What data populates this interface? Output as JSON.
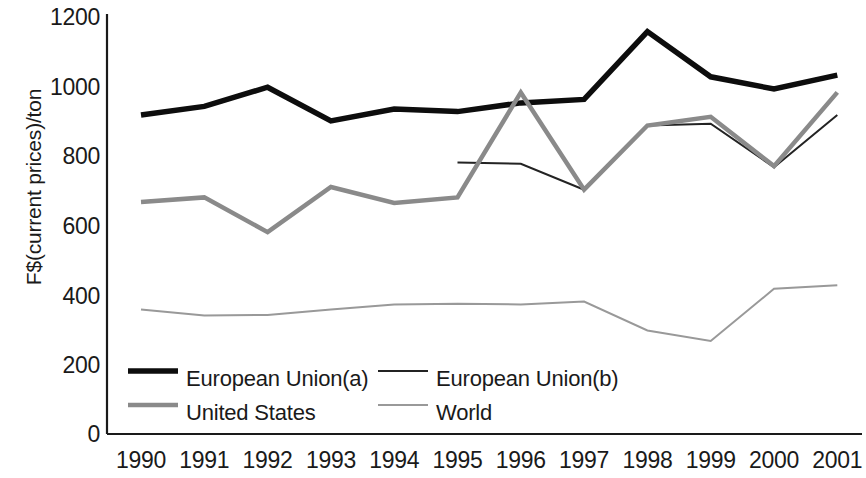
{
  "chart_data": {
    "type": "line",
    "title": "",
    "xlabel": "",
    "ylabel": "F$(current prices)/ton",
    "x": [
      1990,
      1991,
      1992,
      1993,
      1994,
      1995,
      1996,
      1997,
      1998,
      1999,
      2000,
      2001
    ],
    "categories": [
      "1990",
      "1991",
      "1992",
      "1993",
      "1994",
      "1995",
      "1996",
      "1997",
      "1998",
      "1999",
      "2000",
      "2001"
    ],
    "ylim": [
      0,
      1200
    ],
    "yticks": [
      0,
      200,
      400,
      600,
      800,
      1000,
      1200
    ],
    "ytick_labels": [
      "0",
      "200",
      "400",
      "600",
      "800",
      "1000",
      "1200"
    ],
    "grid": false,
    "legend_position": "inside-bottom-left",
    "series": [
      {
        "name": "European Union(a)",
        "color": "#0d0d0d",
        "width": 5.5,
        "x": [
          1990,
          1991,
          1992,
          1993,
          1994,
          1995,
          1996,
          1997,
          1998,
          1999,
          2000,
          2001
        ],
        "values": [
          915,
          940,
          995,
          898,
          932,
          925,
          950,
          960,
          1155,
          1025,
          990,
          1030
        ]
      },
      {
        "name": "European Union(b)",
        "color": "#232323",
        "width": 2,
        "x": [
          1995,
          1996,
          1997,
          1998,
          1999,
          2000,
          2001
        ],
        "values": [
          778,
          775,
          700,
          885,
          890,
          765,
          915
        ]
      },
      {
        "name": "United States",
        "color": "#8a8a8a",
        "width": 4.5,
        "x": [
          1990,
          1991,
          1992,
          1993,
          1994,
          1995,
          1996,
          1997,
          1998,
          1999,
          2000,
          2001
        ],
        "values": [
          665,
          678,
          578,
          708,
          662,
          678,
          980,
          700,
          885,
          910,
          768,
          980
        ]
      },
      {
        "name": "World",
        "color": "#999999",
        "width": 2,
        "x": [
          1990,
          1991,
          1992,
          1993,
          1994,
          1995,
          1996,
          1997,
          1998,
          1999,
          2000,
          2001
        ],
        "values": [
          355,
          338,
          340,
          355,
          370,
          372,
          370,
          378,
          295,
          265,
          415,
          425
        ]
      }
    ]
  },
  "axis": {
    "ylabel": "F$(current prices)/ton",
    "ytick_labels": [
      "1200",
      "1000",
      "800",
      "600",
      "400",
      "200",
      "0"
    ],
    "xtick_labels": [
      "1990",
      "1991",
      "1992",
      "1993",
      "1994",
      "1995",
      "1996",
      "1997",
      "1998",
      "1999",
      "2000",
      "2001"
    ],
    "axis_color": "#1a1a1a"
  },
  "legend": {
    "entries": [
      {
        "label": "European Union(a)",
        "series": "European Union(a)",
        "color": "#0d0d0d",
        "width": 5.5
      },
      {
        "label": "European Union(b)",
        "series": "European Union(b)",
        "color": "#232323",
        "width": 2
      },
      {
        "label": "United States",
        "series": "United States",
        "color": "#8a8a8a",
        "width": 4.5
      },
      {
        "label": "World",
        "series": "World",
        "color": "#999999",
        "width": 2
      }
    ]
  }
}
